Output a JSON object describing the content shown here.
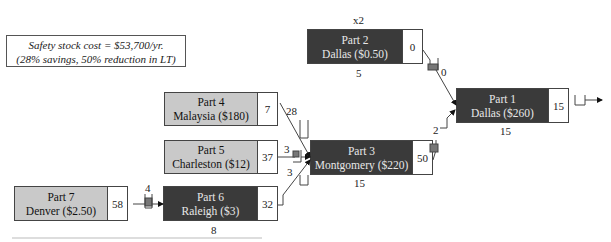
{
  "note": {
    "line1": "Safety stock cost = $53,700/yr.",
    "line2": "(28% savings, 50% reduction in LT)"
  },
  "stages": {
    "part1": {
      "name": "Part 1",
      "loc": "Dallas ($260)",
      "value": "15",
      "below": "15"
    },
    "part2": {
      "name": "Part 2",
      "loc": "Dallas ($0.50)",
      "value": "0",
      "below": "5",
      "above": "x2"
    },
    "part3": {
      "name": "Part 3",
      "loc": "Montgomery ($220)",
      "value": "50",
      "below": "15"
    },
    "part4": {
      "name": "Part 4",
      "loc": "Malaysia ($180)",
      "value": "7"
    },
    "part5": {
      "name": "Part 5",
      "loc": "Charleston ($12)",
      "value": "37"
    },
    "part6": {
      "name": "Part 6",
      "loc": "Raleigh ($3)",
      "value": "32",
      "below": "8"
    },
    "part7": {
      "name": "Part 7",
      "loc": "Denver ($2.50)",
      "value": "58"
    }
  },
  "links": {
    "p2_p1": "0",
    "p3_p1": "2",
    "p4_p3": "28",
    "p5_p3": "3",
    "p6_p3": "3",
    "p7_p6": "4"
  },
  "colors": {
    "dark": "#3a3a3a",
    "light": "#c9c9c9",
    "inventory": "#777777"
  }
}
